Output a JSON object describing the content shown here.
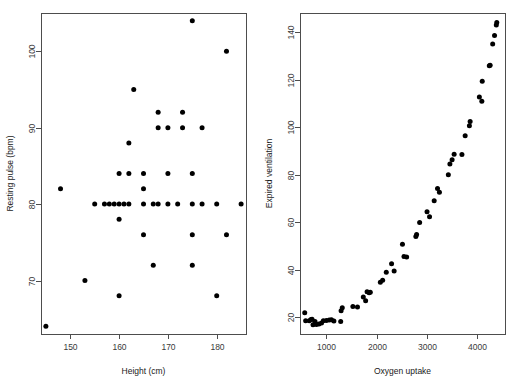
{
  "figure": {
    "background": "#ffffff",
    "point_color": "#000000",
    "axis_color": "#4d4d4d",
    "panel_count": 2
  },
  "chart_data": [
    {
      "type": "scatter",
      "panel": "left",
      "title": "",
      "xlabel": "Height (cm)",
      "ylabel": "Resting pulse (bpm)",
      "xlim": [
        144,
        186
      ],
      "ylim": [
        63,
        105
      ],
      "xticks": [
        150,
        160,
        170,
        180
      ],
      "yticks": [
        70,
        80,
        90,
        100
      ],
      "grid": false,
      "legend": "none",
      "points": [
        [
          145,
          64
        ],
        [
          148,
          82
        ],
        [
          153,
          70
        ],
        [
          155,
          80
        ],
        [
          157,
          80
        ],
        [
          158,
          80
        ],
        [
          159,
          80
        ],
        [
          160,
          68
        ],
        [
          160,
          78
        ],
        [
          160,
          80
        ],
        [
          160,
          84
        ],
        [
          161,
          80
        ],
        [
          162,
          80
        ],
        [
          162,
          84
        ],
        [
          162,
          88
        ],
        [
          163,
          95
        ],
        [
          165,
          76
        ],
        [
          165,
          80
        ],
        [
          165,
          82
        ],
        [
          165,
          84
        ],
        [
          167,
          72
        ],
        [
          167,
          80
        ],
        [
          168,
          80
        ],
        [
          168,
          90
        ],
        [
          168,
          92
        ],
        [
          170,
          80
        ],
        [
          170,
          84
        ],
        [
          170,
          90
        ],
        [
          172,
          80
        ],
        [
          173,
          90
        ],
        [
          173,
          92
        ],
        [
          175,
          72
        ],
        [
          175,
          76
        ],
        [
          175,
          80
        ],
        [
          175,
          84
        ],
        [
          175,
          104
        ],
        [
          177,
          80
        ],
        [
          177,
          90
        ],
        [
          180,
          68
        ],
        [
          180,
          80
        ],
        [
          182,
          76
        ],
        [
          182,
          100
        ],
        [
          185,
          80
        ]
      ]
    },
    {
      "type": "scatter",
      "panel": "right",
      "title": "",
      "xlabel": "Oxygen uptake",
      "ylabel": "Expired ventilation",
      "xlim": [
        480,
        4550
      ],
      "ylim": [
        13,
        148
      ],
      "xticks": [
        1000,
        2000,
        3000,
        4000
      ],
      "yticks": [
        20,
        40,
        60,
        80,
        100,
        120,
        140
      ],
      "grid": false,
      "legend": "none",
      "points": [
        [
          574,
          21.9
        ],
        [
          592,
          18.6
        ],
        [
          664,
          18.6
        ],
        [
          697,
          19.1
        ],
        [
          719,
          19.2
        ],
        [
          738,
          16.9
        ],
        [
          778,
          18.3
        ],
        [
          805,
          17.0
        ],
        [
          856,
          17.2
        ],
        [
          907,
          17.6
        ],
        [
          944,
          18.6
        ],
        [
          1004,
          18.7
        ],
        [
          1061,
          18.9
        ],
        [
          1104,
          19.0
        ],
        [
          1153,
          18.5
        ],
        [
          1288,
          18.3
        ],
        [
          1296,
          22.8
        ],
        [
          1319,
          24.0
        ],
        [
          1530,
          24.6
        ],
        [
          1621,
          24.4
        ],
        [
          1737,
          28.6
        ],
        [
          1783,
          27.0
        ],
        [
          1812,
          30.8
        ],
        [
          1852,
          30.4
        ],
        [
          1876,
          30.6
        ],
        [
          2075,
          34.8
        ],
        [
          2121,
          35.6
        ],
        [
          2193,
          39.0
        ],
        [
          2298,
          42.5
        ],
        [
          2349,
          39.5
        ],
        [
          2514,
          50.7
        ],
        [
          2544,
          45.6
        ],
        [
          2597,
          45.4
        ],
        [
          2780,
          54.0
        ],
        [
          2795,
          54.8
        ],
        [
          2855,
          59.9
        ],
        [
          3002,
          64.4
        ],
        [
          3052,
          62.3
        ],
        [
          3144,
          69.0
        ],
        [
          3210,
          74.2
        ],
        [
          3248,
          72.6
        ],
        [
          3425,
          80.0
        ],
        [
          3456,
          84.5
        ],
        [
          3500,
          86.3
        ],
        [
          3540,
          88.6
        ],
        [
          3695,
          88.5
        ],
        [
          3759,
          96.4
        ],
        [
          3843,
          100.6
        ],
        [
          3858,
          102.4
        ],
        [
          4041,
          112.7
        ],
        [
          4090,
          110.9
        ],
        [
          4098,
          119.3
        ],
        [
          4238,
          125.8
        ],
        [
          4255,
          126.0
        ],
        [
          4305,
          135.0
        ],
        [
          4342,
          138.5
        ],
        [
          4377,
          143.0
        ],
        [
          4387,
          144.0
        ]
      ]
    }
  ]
}
